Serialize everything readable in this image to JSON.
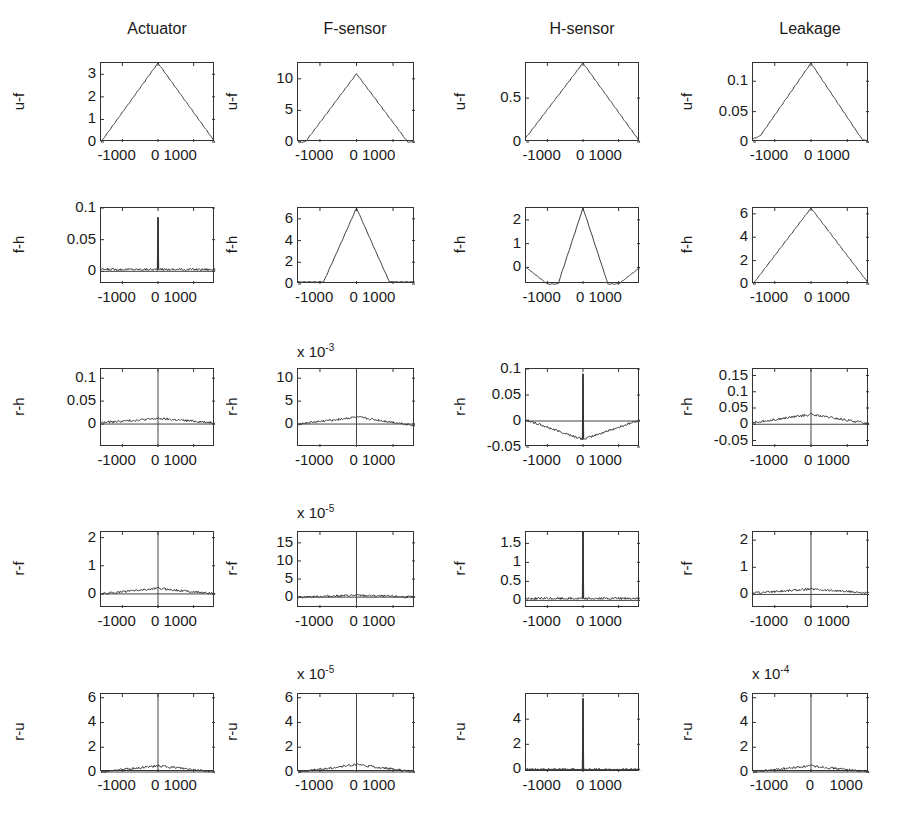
{
  "figure": {
    "columns": [
      "Actuator",
      "F-sensor",
      "H-sensor",
      "Leakage"
    ],
    "rows": [
      "u-f",
      "f-h",
      "r-h",
      "r-f",
      "r-u"
    ]
  },
  "chart_data": {
    "type": "line",
    "layout": "5x4 subplot grid of correlation functions versus lag",
    "xlabel": "lag",
    "xlim": [
      -1600,
      1600
    ],
    "x_ticks": [
      -1000,
      0,
      1000
    ],
    "column_titles": [
      "Actuator",
      "F-sensor",
      "H-sensor",
      "Leakage"
    ],
    "row_labels": [
      "u-f",
      "f-h",
      "r-h",
      "r-f",
      "r-u"
    ],
    "panels": [
      {
        "row": "u-f",
        "column": "Actuator",
        "ylabel": "u-f",
        "yticks": [
          "0",
          "1",
          "2",
          "3"
        ],
        "ylim": [
          0,
          3.5
        ],
        "multiplier": "",
        "shape": "triangle",
        "peak": 3.5,
        "x": [
          -1600,
          0,
          1600
        ],
        "y": [
          0,
          3.5,
          0
        ]
      },
      {
        "row": "u-f",
        "column": "F-sensor",
        "ylabel": "u-f",
        "yticks": [
          "0",
          "5",
          "10"
        ],
        "ylim": [
          0,
          12.5
        ],
        "multiplier": "",
        "shape": "triangle",
        "peak": 10.8,
        "x": [
          -1600,
          -1400,
          0,
          1400,
          1600
        ],
        "y": [
          0,
          0,
          10.8,
          0,
          0
        ]
      },
      {
        "row": "u-f",
        "column": "H-sensor",
        "ylabel": "u-f",
        "yticks": [
          "0",
          "0.5"
        ],
        "ylim": [
          0,
          0.9
        ],
        "multiplier": "",
        "shape": "triangle",
        "peak": 0.9,
        "x": [
          -1600,
          0,
          1600
        ],
        "y": [
          0.05,
          0.9,
          0
        ]
      },
      {
        "row": "u-f",
        "column": "Leakage",
        "ylabel": "u-f",
        "yticks": [
          "0",
          "0.05",
          "0.1"
        ],
        "ylim": [
          0,
          0.13
        ],
        "multiplier": "",
        "shape": "triangle",
        "peak": 0.13,
        "x": [
          -1600,
          -1400,
          0,
          1400,
          1600
        ],
        "y": [
          0.005,
          0.01,
          0.13,
          0.005,
          0
        ]
      },
      {
        "row": "f-h",
        "column": "Actuator",
        "ylabel": "f-h",
        "yticks": [
          "0",
          "0.05",
          "0.1"
        ],
        "ylim": [
          -0.02,
          0.1
        ],
        "multiplier": "",
        "shape": "noise-with-spike",
        "peak": 0.085,
        "x": [
          -1600,
          -10,
          0,
          10,
          1600
        ],
        "y": [
          0.003,
          0.003,
          0.085,
          0.003,
          0.003
        ]
      },
      {
        "row": "f-h",
        "column": "F-sensor",
        "ylabel": "f-h",
        "yticks": [
          "0",
          "2",
          "4",
          "6"
        ],
        "ylim": [
          0,
          7
        ],
        "multiplier": "",
        "shape": "bell",
        "peak": 7,
        "x": [
          -1600,
          -900,
          -500,
          0,
          500,
          900,
          1600
        ],
        "y": [
          0.2,
          0.2,
          3.2,
          7,
          3.2,
          0.2,
          0.2
        ]
      },
      {
        "row": "f-h",
        "column": "H-sensor",
        "ylabel": "f-h",
        "yticks": [
          "0",
          "1",
          "2"
        ],
        "ylim": [
          -0.7,
          2.5
        ],
        "multiplier": "",
        "shape": "sinc-like",
        "peak": 2.5,
        "x": [
          -1600,
          -1000,
          -700,
          0,
          700,
          1000,
          1600
        ],
        "y": [
          0,
          -0.7,
          -0.7,
          2.5,
          -0.7,
          -0.7,
          0
        ]
      },
      {
        "row": "f-h",
        "column": "Leakage",
        "ylabel": "f-h",
        "yticks": [
          "0",
          "2",
          "4",
          "6"
        ],
        "ylim": [
          0,
          6.5
        ],
        "multiplier": "",
        "shape": "triangle",
        "peak": 6.5,
        "x": [
          -1600,
          0,
          1600
        ],
        "y": [
          0,
          6.5,
          0
        ]
      },
      {
        "row": "r-h",
        "column": "Actuator",
        "ylabel": "r-h",
        "yticks": [
          "0",
          "0.05",
          "0.1"
        ],
        "ylim": [
          -0.05,
          0.12
        ],
        "multiplier": "",
        "shape": "noise-with-center-line",
        "peak": 0.02,
        "x": [
          -1600,
          0,
          1600
        ],
        "y": [
          0.003,
          0.012,
          0.003
        ]
      },
      {
        "row": "r-h",
        "column": "F-sensor",
        "ylabel": "r-h",
        "yticks": [
          "0",
          "5",
          "10"
        ],
        "ylim": [
          -5,
          12
        ],
        "multiplier": "x 10^-3",
        "shape": "noise-with-center-line",
        "peak": 1.5,
        "x": [
          -1600,
          0,
          1600
        ],
        "y": [
          0,
          1.5,
          -0.3
        ]
      },
      {
        "row": "r-h",
        "column": "H-sensor",
        "ylabel": "r-h",
        "yticks": [
          "-0.05",
          "0",
          "0.05",
          "0.1"
        ],
        "ylim": [
          -0.05,
          0.1
        ],
        "multiplier": "",
        "shape": "noise-with-spike",
        "peak": 0.09,
        "x": [
          -1600,
          -10,
          0,
          10,
          1600
        ],
        "y": [
          0.002,
          -0.035,
          0.09,
          -0.035,
          0.002
        ]
      },
      {
        "row": "r-h",
        "column": "Leakage",
        "ylabel": "r-h",
        "yticks": [
          "-0.05",
          "0",
          "0.05",
          "0.1",
          "0.15"
        ],
        "ylim": [
          -0.07,
          0.17
        ],
        "multiplier": "",
        "shape": "noise-with-center-line",
        "peak": 0.03,
        "x": [
          -1600,
          0,
          1600
        ],
        "y": [
          0.005,
          0.03,
          0.002
        ]
      },
      {
        "row": "r-f",
        "column": "Actuator",
        "ylabel": "r-f",
        "yticks": [
          "0",
          "1",
          "2"
        ],
        "ylim": [
          -0.5,
          2.2
        ],
        "multiplier": "",
        "shape": "noise-with-center-line",
        "peak": 0.2,
        "x": [
          -1600,
          0,
          1600
        ],
        "y": [
          0,
          0.2,
          0
        ]
      },
      {
        "row": "r-f",
        "column": "F-sensor",
        "ylabel": "r-f",
        "yticks": [
          "0",
          "5",
          "10",
          "15"
        ],
        "ylim": [
          -3,
          18
        ],
        "multiplier": "x 10^-5",
        "shape": "noise-with-center-line",
        "peak": 1,
        "x": [
          -1600,
          0,
          1600
        ],
        "y": [
          0,
          0.5,
          0
        ]
      },
      {
        "row": "r-f",
        "column": "H-sensor",
        "ylabel": "r-f",
        "yticks": [
          "0",
          "0.5",
          "1",
          "1.5"
        ],
        "ylim": [
          -0.2,
          1.8
        ],
        "multiplier": "",
        "shape": "noise-with-spike",
        "peak": 1.8,
        "x": [
          -1600,
          -10,
          0,
          10,
          1600
        ],
        "y": [
          0.05,
          0.05,
          1.8,
          0.05,
          0.05
        ]
      },
      {
        "row": "r-f",
        "column": "Leakage",
        "ylabel": "r-f",
        "yticks": [
          "0",
          "1",
          "2"
        ],
        "ylim": [
          -0.5,
          2.3
        ],
        "multiplier": "",
        "shape": "noise-with-center-line",
        "peak": 0.3,
        "x": [
          -1600,
          0,
          1600
        ],
        "y": [
          0.05,
          0.2,
          0.05
        ]
      },
      {
        "row": "r-u",
        "column": "Actuator",
        "ylabel": "r-u",
        "yticks": [
          "0",
          "2",
          "4",
          "6"
        ],
        "ylim": [
          0,
          6.3
        ],
        "multiplier": "",
        "shape": "noise-with-center-line",
        "peak": 0.5,
        "x": [
          -1600,
          0,
          1600
        ],
        "y": [
          0,
          0.5,
          0
        ]
      },
      {
        "row": "r-u",
        "column": "F-sensor",
        "ylabel": "r-u",
        "yticks": [
          "0",
          "2",
          "4",
          "6"
        ],
        "ylim": [
          0,
          6.3
        ],
        "multiplier": "x 10^-5",
        "shape": "noise-with-center-line",
        "peak": 0.6,
        "x": [
          -1600,
          0,
          1600
        ],
        "y": [
          0,
          0.6,
          0
        ]
      },
      {
        "row": "r-u",
        "column": "H-sensor",
        "ylabel": "r-u",
        "yticks": [
          "0",
          "2",
          "4"
        ],
        "ylim": [
          -0.2,
          6
        ],
        "multiplier": "",
        "shape": "noise-with-spike",
        "peak": 5.6,
        "x": [
          -1600,
          -10,
          0,
          10,
          1600
        ],
        "y": [
          0,
          0,
          5.6,
          0,
          0
        ]
      },
      {
        "row": "r-u",
        "column": "Leakage",
        "ylabel": "r-u",
        "yticks": [
          "0",
          "2",
          "4",
          "6"
        ],
        "ylim": [
          0,
          6.3
        ],
        "multiplier": "x 10^-4",
        "shape": "noise-with-center-line",
        "peak": 0.5,
        "x": [
          -1600,
          0,
          1600
        ],
        "y": [
          0,
          0.5,
          0
        ]
      }
    ]
  },
  "labels": {
    "xticks_default": [
      "-1000",
      "0 1000"
    ],
    "xticks_last": [
      "-1000",
      "0",
      "1000"
    ],
    "mult_fsensor_rh": "x 10",
    "mult_fsensor_rh_exp": "-3",
    "mult_fsensor_rf": "x 10",
    "mult_fsensor_rf_exp": "-5",
    "mult_fsensor_ru": "x 10",
    "mult_fsensor_ru_exp": "-5",
    "mult_leakage_ru": "x 10",
    "mult_leakage_ru_exp": "-4"
  }
}
